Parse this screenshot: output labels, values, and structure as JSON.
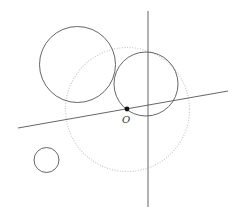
{
  "diagram": {
    "background": "#ffffff",
    "stroke_color": "#555555",
    "dotted_color": "#c8c8c8",
    "point_color": "#111111",
    "origin": {
      "label": "O",
      "x": 127,
      "y": 109,
      "label_x": 122,
      "label_y": 123
    },
    "lines": [
      {
        "name": "slanted-line",
        "x1": 18,
        "y1": 128,
        "x2": 228,
        "y2": 91
      },
      {
        "name": "vertical-line",
        "x1": 148,
        "y1": 11,
        "x2": 148,
        "y2": 207
      }
    ],
    "circles": [
      {
        "name": "large-circle-top-left",
        "cx": 77.5,
        "cy": 64.5,
        "r": 38,
        "style": "solid"
      },
      {
        "name": "circle-through-origin",
        "cx": 146,
        "cy": 84,
        "r": 32,
        "style": "solid"
      },
      {
        "name": "small-circle-bottom-left",
        "cx": 46.5,
        "cy": 160,
        "r": 12.5,
        "style": "solid"
      },
      {
        "name": "dotted-circle-centered-origin",
        "cx": 127.5,
        "cy": 109.5,
        "r": 62,
        "style": "dotted"
      }
    ]
  }
}
